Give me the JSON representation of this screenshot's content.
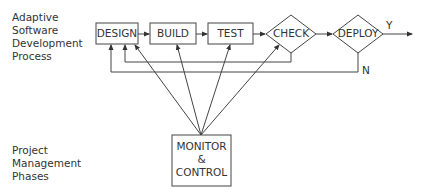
{
  "diagram": {
    "left_labels": {
      "top": [
        "Adaptive",
        "Software",
        "Development",
        "Process"
      ],
      "bottom": [
        "Project",
        "Management",
        "Phases"
      ]
    },
    "process_steps": [
      {
        "id": "design",
        "label": "DESIGN",
        "shape": "rectangle"
      },
      {
        "id": "build",
        "label": "BUILD",
        "shape": "rectangle"
      },
      {
        "id": "test",
        "label": "TEST",
        "shape": "rectangle"
      },
      {
        "id": "check",
        "label": "CHECK",
        "shape": "diamond"
      },
      {
        "id": "deploy",
        "label": "DEPLOY",
        "shape": "diamond"
      }
    ],
    "decision_labels": {
      "yes": "Y",
      "no": "N"
    },
    "monitor_box": {
      "lines": [
        "MONITOR",
        "&",
        "CONTROL"
      ]
    },
    "edges": [
      {
        "from": "design",
        "to": "build"
      },
      {
        "from": "build",
        "to": "test"
      },
      {
        "from": "test",
        "to": "check"
      },
      {
        "from": "check",
        "to": "deploy"
      },
      {
        "from": "deploy",
        "to": "output",
        "label": "Y"
      },
      {
        "from": "check",
        "to": "design",
        "type": "feedback"
      },
      {
        "from": "deploy",
        "to": "design",
        "type": "feedback",
        "label": "N"
      },
      {
        "from": "monitor",
        "to": "design"
      },
      {
        "from": "monitor",
        "to": "build"
      },
      {
        "from": "monitor",
        "to": "test"
      },
      {
        "from": "monitor",
        "to": "check"
      }
    ],
    "colors": {
      "stroke": "#333333",
      "background": "#ffffff",
      "text": "#333333"
    }
  }
}
